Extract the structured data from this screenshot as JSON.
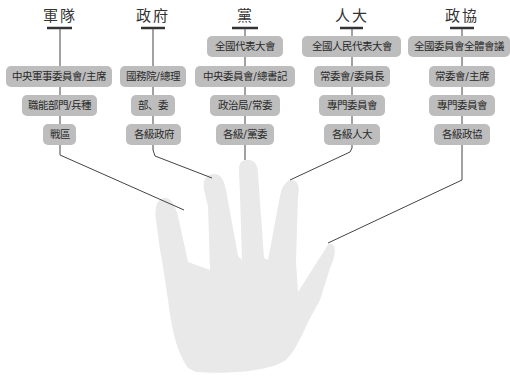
{
  "diagram": {
    "caption_faint": "",
    "columns": [
      {
        "title": "軍隊",
        "boxes": [
          "中央軍事委員會/主席",
          "職能部門/兵種",
          "戰區"
        ]
      },
      {
        "title": "政府",
        "boxes": [
          "國務院/總理",
          "部、委",
          "各級政府"
        ]
      },
      {
        "title": "黨",
        "boxes": [
          "全國代表大會",
          "中央委員會/總書記",
          "政治局/常委",
          "各級/黨委"
        ]
      },
      {
        "title": "人大",
        "boxes": [
          "全國人民代表大會",
          "常委會/委員長",
          "專門委員會",
          "各級人大"
        ]
      },
      {
        "title": "政協",
        "boxes": [
          "全國委員會全體會議",
          "常委會/主席",
          "專門委員會",
          "各級政協"
        ]
      }
    ],
    "hand": {
      "label": "hand-silhouette",
      "fingers": 5
    },
    "colors": {
      "box_fill": "#bdbdbd",
      "line": "#444444",
      "hand_fill": "#e9e9e9",
      "text": "#2a2a2a"
    }
  }
}
